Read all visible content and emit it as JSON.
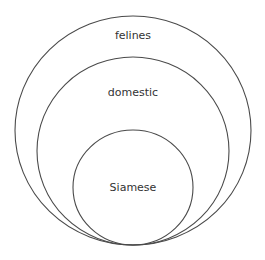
{
  "diagram": {
    "type": "nested-euler-diagram",
    "background": "#ffffff",
    "stroke_color": "#4a4a4a",
    "text_color": "#333333",
    "sets": [
      {
        "label": "felines",
        "cx": 133,
        "cy": 130.5,
        "rx": 118,
        "ry": 114.5,
        "label_y": 36
      },
      {
        "label": "domestic",
        "cx": 133,
        "cy": 151,
        "rx": 96,
        "ry": 94,
        "label_y": 93
      },
      {
        "label": "Siamese",
        "cx": 133,
        "cy": 187.5,
        "rx": 60,
        "ry": 57.5,
        "label_y": 188
      }
    ],
    "relationship": "Siamese ⊂ domestic ⊂ felines"
  }
}
